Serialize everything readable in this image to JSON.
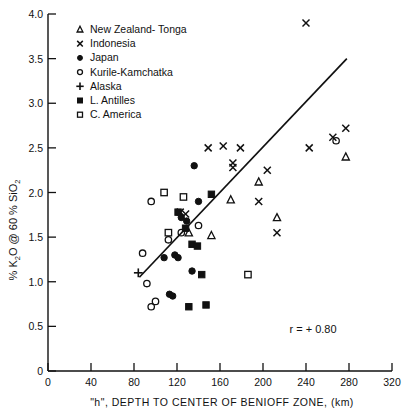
{
  "chart_data": {
    "type": "scatter",
    "title": "",
    "xlabel": "\"h\", DEPTH TO CENTER OF BENIOFF ZONE, (km)",
    "ylabel": "% K2O @ 60 % SiO2",
    "ylabel_parts": {
      "pre": "% K",
      "sub1": "2",
      "mid": "O @ 60 % SiO",
      "sub2": "2"
    },
    "xlim": [
      0,
      320
    ],
    "ylim": [
      0,
      4.0
    ],
    "xticks": [
      0,
      40,
      80,
      120,
      160,
      200,
      240,
      280,
      320
    ],
    "yticks": [
      "0",
      "0.5",
      "1.0",
      "1.5",
      "2.0",
      "2.5",
      "3.0",
      "3.5",
      "4.0"
    ],
    "ytick_values": [
      0,
      0.5,
      1.0,
      1.5,
      2.0,
      2.5,
      3.0,
      3.5,
      4.0
    ],
    "grid": false,
    "legend_position": "top-left",
    "annotation": "r = + 0.80",
    "trendline": {
      "x1": 85,
      "y1": 1.05,
      "x2": 278,
      "y2": 3.5
    },
    "series": [
      {
        "name": "New Zealand-Tonga",
        "marker": "triangle-open",
        "points": [
          [
            131,
            1.55
          ],
          [
            152,
            1.52
          ],
          [
            170,
            1.92
          ],
          [
            196,
            2.12
          ],
          [
            213,
            1.72
          ],
          [
            277,
            2.4
          ]
        ]
      },
      {
        "name": "Indonesia",
        "marker": "cross-x",
        "points": [
          [
            149,
            2.5
          ],
          [
            163,
            2.52
          ],
          [
            172,
            2.33
          ],
          [
            172,
            2.28
          ],
          [
            179,
            2.5
          ],
          [
            196,
            1.9
          ],
          [
            204,
            2.25
          ],
          [
            213,
            1.55
          ],
          [
            240,
            3.9
          ],
          [
            243,
            2.5
          ],
          [
            265,
            2.62
          ],
          [
            277,
            2.72
          ],
          [
            123,
            1.78
          ],
          [
            128,
            1.76
          ]
        ]
      },
      {
        "name": "Japan",
        "marker": "circle-filled",
        "points": [
          [
            124,
            1.72
          ],
          [
            129,
            1.68
          ],
          [
            136,
            2.3
          ],
          [
            140,
            1.9
          ],
          [
            118,
            1.3
          ],
          [
            121,
            1.27
          ],
          [
            113,
            0.86
          ],
          [
            116,
            0.84
          ],
          [
            134,
            1.12
          ],
          [
            108,
            1.27
          ]
        ]
      },
      {
        "name": "Kurile-Kamchatka",
        "marker": "circle-open",
        "points": [
          [
            96,
            1.9
          ],
          [
            88,
            1.32
          ],
          [
            92,
            0.98
          ],
          [
            96,
            0.72
          ],
          [
            100,
            0.78
          ],
          [
            112,
            1.47
          ],
          [
            124,
            1.55
          ],
          [
            140,
            1.63
          ],
          [
            268,
            2.58
          ]
        ]
      },
      {
        "name": "Alaska",
        "marker": "plus",
        "points": [
          [
            84,
            1.1
          ]
        ]
      },
      {
        "name": "L. Antilles",
        "marker": "square-filled",
        "points": [
          [
            128,
            1.6
          ],
          [
            134,
            1.42
          ],
          [
            139,
            1.4
          ],
          [
            143,
            1.08
          ],
          [
            147,
            0.74
          ],
          [
            131,
            0.72
          ],
          [
            152,
            1.98
          ],
          [
            121,
            1.78
          ]
        ]
      },
      {
        "name": "C. America",
        "marker": "square-open",
        "points": [
          [
            108,
            2.0
          ],
          [
            112,
            1.55
          ],
          [
            186,
            1.08
          ],
          [
            126,
            1.95
          ]
        ]
      }
    ]
  },
  "legend": {
    "items": [
      {
        "label": "New Zealand- Tonga",
        "marker": "triangle-open"
      },
      {
        "label": "Indonesia",
        "marker": "cross-x"
      },
      {
        "label": "Japan",
        "marker": "circle-filled"
      },
      {
        "label": "Kurile-Kamchatka",
        "marker": "circle-open"
      },
      {
        "label": "Alaska",
        "marker": "plus"
      },
      {
        "label": "L. Antilles",
        "marker": "square-filled"
      },
      {
        "label": "C. America",
        "marker": "square-open"
      }
    ]
  },
  "colors": {
    "ink": "#111111",
    "background": "#ffffff"
  }
}
